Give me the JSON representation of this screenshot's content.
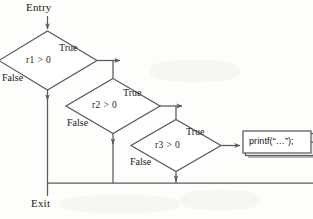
{
  "diagram": {
    "entry_label": "Entry",
    "exit_label": "Exit",
    "stroke_color": "#5a5a5a",
    "text_color": "#1a1a1a",
    "shadow_color": "#b4b4b4",
    "node_fill": "#ffffff",
    "decisions": [
      {
        "id": "d1",
        "text": "r1 > 0",
        "true_label": "True",
        "false_label": "False"
      },
      {
        "id": "d2",
        "text": "r2 > 0",
        "true_label": "True",
        "false_label": "False"
      },
      {
        "id": "d3",
        "text": "r3 > 0",
        "true_label": "True",
        "false_label": "False"
      }
    ],
    "process": {
      "id": "p1",
      "text": "printf(“…”);"
    }
  }
}
